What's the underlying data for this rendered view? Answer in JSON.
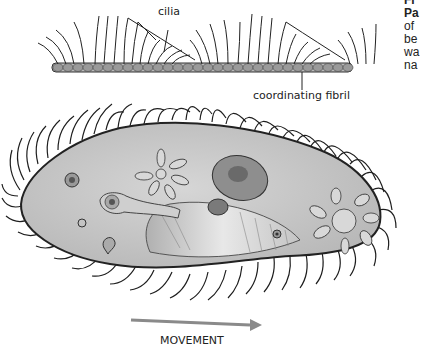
{
  "figure": {
    "labels": {
      "cilia": "cilia",
      "coordinating_fibril": "coordinating fibril",
      "movement": "MOVEMENT"
    },
    "caption_fragments": [
      "Fi",
      "Pa",
      "of",
      "be",
      "wa",
      "na"
    ],
    "colors": {
      "cell_fill": "#c8c8c8",
      "outline": "#2a2a2a",
      "arrow": "#8a8a8a",
      "background": "#ffffff"
    }
  }
}
